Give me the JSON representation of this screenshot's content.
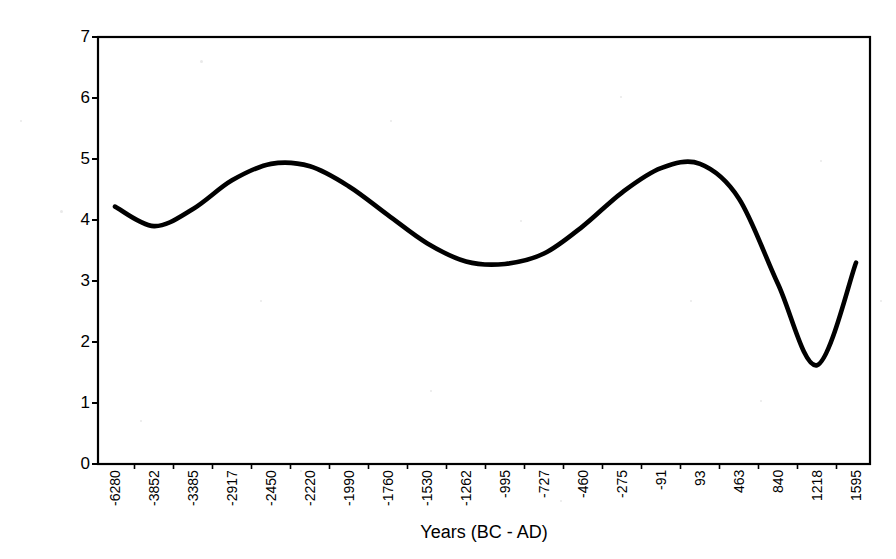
{
  "chart_data": {
    "type": "line",
    "title": "",
    "xlabel": "Years (BC - AD)",
    "ylabel": "Arboreal/NonArboreal Pollen %",
    "grid": false,
    "legend": null,
    "ylim": [
      0,
      7
    ],
    "y_ticks": [
      0,
      1,
      2,
      3,
      4,
      5,
      6,
      7
    ],
    "categories": [
      "-6280",
      "-3852",
      "-3385",
      "-2917",
      "-2450",
      "-2220",
      "-1990",
      "-1760",
      "-1530",
      "-1262",
      "-995",
      "-727",
      "-460",
      "-275",
      "-91",
      "93",
      "463",
      "840",
      "1218",
      "1595"
    ],
    "series": [
      {
        "name": "Arboreal/NonArboreal Pollen %",
        "color": "#000000",
        "values": [
          4.22,
          3.9,
          4.18,
          4.65,
          4.92,
          4.88,
          4.55,
          4.08,
          3.62,
          3.32,
          3.28,
          3.45,
          3.9,
          4.45,
          4.85,
          4.92,
          4.35,
          2.95,
          1.62,
          3.3
        ]
      }
    ],
    "annotations": []
  },
  "axes": {
    "x_axis_title": "Years (BC - AD)",
    "y_axis_title": "Arboreal/NonArboreal Pollen %",
    "y_labels": [
      "7",
      "6",
      "5",
      "4",
      "3",
      "2",
      "1",
      "0"
    ],
    "x_labels": [
      "-6280",
      "-3852",
      "-3385",
      "-2917",
      "-2450",
      "-2220",
      "-1990",
      "-1760",
      "-1530",
      "-1262",
      "-995",
      "-727",
      "-460",
      "-275",
      "-91",
      "93",
      "463",
      "840",
      "1218",
      "1595"
    ]
  },
  "colors": {
    "line": "#000000",
    "axis": "#000000",
    "background": "#ffffff"
  }
}
